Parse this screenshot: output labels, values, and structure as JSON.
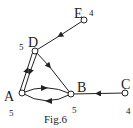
{
  "figure": {
    "caption": "Fig.6",
    "nodes": [
      {
        "id": "A",
        "label": "A",
        "weight": "5"
      },
      {
        "id": "B",
        "label": "B",
        "weight": "5"
      },
      {
        "id": "C",
        "label": "C",
        "weight": "4"
      },
      {
        "id": "D",
        "label": "D",
        "weight": "5"
      },
      {
        "id": "E",
        "label": "E",
        "weight": "4"
      }
    ],
    "edges": [
      {
        "from": "E",
        "to": "D"
      },
      {
        "from": "A",
        "to": "D"
      },
      {
        "from": "D",
        "to": "A"
      },
      {
        "from": "D",
        "to": "B"
      },
      {
        "from": "A",
        "to": "B"
      },
      {
        "from": "B",
        "to": "A"
      },
      {
        "from": "C",
        "to": "B"
      }
    ]
  }
}
